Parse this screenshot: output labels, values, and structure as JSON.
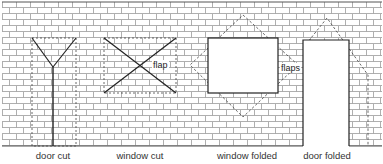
{
  "diagram": {
    "type": "brick wall cutting and folding illustration",
    "wall": {
      "x": 2,
      "y": 2,
      "width": 380,
      "height": 144,
      "row_height": 6,
      "brick_width": 14,
      "mortar_color": "#8a8a8a",
      "background": "#ffffff"
    },
    "panels": [
      {
        "id": "door-cut",
        "caption": "door cut",
        "caption_x": 53
      },
      {
        "id": "window-cut",
        "caption": "window cut",
        "caption_x": 140,
        "inner_label": "flap"
      },
      {
        "id": "window-folded",
        "caption": "window folded",
        "caption_x": 247,
        "inner_label": "flaps"
      },
      {
        "id": "door-folded",
        "caption": "door folded",
        "caption_x": 327
      }
    ],
    "colors": {
      "line": "#222222",
      "dashed": "#444444",
      "text": "#333333"
    }
  }
}
